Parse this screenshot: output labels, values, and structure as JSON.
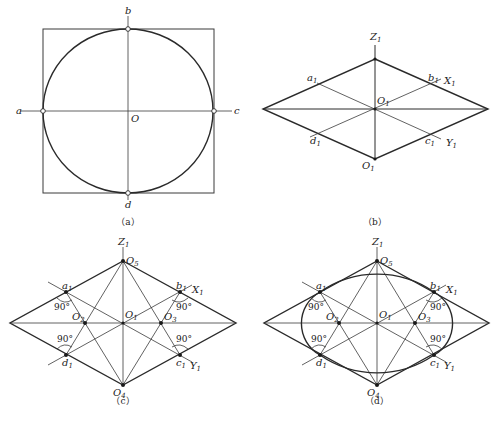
{
  "figure": {
    "panels": {
      "a": {
        "caption": "（a）",
        "labels": {
          "a": "a",
          "b": "b",
          "c": "c",
          "d": "d",
          "O": "O"
        }
      },
      "b": {
        "caption": "（b）",
        "labels": {
          "Z": "Z",
          "Z_sub": "1",
          "X": "X",
          "X_sub": "1",
          "Y": "Y",
          "Y_sub": "1",
          "O_center": "O",
          "O_center_sub": "1",
          "O_bottom": "O",
          "O_bottom_sub": "1",
          "a": "a",
          "a_sub": "1",
          "b": "b",
          "b_sub": "1",
          "c": "c",
          "c_sub": "1",
          "d": "d",
          "d_sub": "1"
        }
      },
      "c": {
        "caption": "（c）",
        "labels": {
          "Z": "Z",
          "Z_sub": "1",
          "X": "X",
          "X_sub": "1",
          "Y": "Y",
          "Y_sub": "1",
          "O1": "O",
          "O1_sub": "1",
          "O2": "O",
          "O2_sub": "2",
          "O3": "O",
          "O3_sub": "3",
          "O4": "O",
          "O4_sub": "4",
          "O5": "O",
          "O5_sub": "5",
          "a": "a",
          "a_sub": "1",
          "b": "b",
          "b_sub": "1",
          "c": "c",
          "c_sub": "1",
          "d": "d",
          "d_sub": "1",
          "angle": "90°"
        }
      },
      "d": {
        "caption": "（d）",
        "labels": {
          "Z": "Z",
          "Z_sub": "1",
          "X": "X",
          "X_sub": "1",
          "Y": "Y",
          "Y_sub": "1",
          "O1": "O",
          "O1_sub": "1",
          "O2": "O",
          "O2_sub": "2",
          "O3": "O",
          "O3_sub": "3",
          "O4": "O",
          "O4_sub": "4",
          "O5": "O",
          "O5_sub": "5",
          "a": "a",
          "a_sub": "1",
          "b": "b",
          "b_sub": "1",
          "c": "c",
          "c_sub": "1",
          "d": "d",
          "d_sub": "1",
          "angle": "90°"
        }
      }
    },
    "colors": {
      "line": "#2a2a2a",
      "background": "#ffffff"
    }
  }
}
